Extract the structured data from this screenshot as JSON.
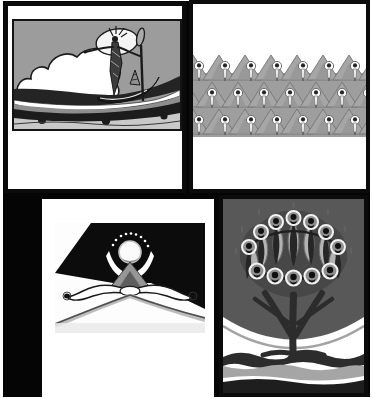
{
  "page": {
    "kind": "scanned-plate-collage",
    "background_color": "#050505",
    "paper_color": "#ffffff",
    "grid": "2x2 plates"
  },
  "plates": {
    "boat": {
      "name": "Haloed figure poling a boat",
      "description": "Thin robed figure with a large white oval halo stands in a gondola holding a long paddle; big scalloped white cloud at left, gray sky, dark sweeping water bands with drips below.",
      "position": "top-left"
    },
    "frieze": {
      "name": "Frieze of haloed figures among peaks",
      "description": "Repeating band of small haloed figures standing before overlapping gray mountain peaks; three staggered rows of seven figures.",
      "position": "top-right",
      "rows": 3,
      "figures_per_row": 7
    },
    "summit": {
      "name": "Orb above summit with bowing figures",
      "description": "Glowing white orb crowned by an arc of dots above a gray peak; two white bowing figures meet at the summit; black diagonal sky wedge; ridge lines descend to the corners.",
      "position": "bottom-left"
    },
    "tree": {
      "name": "Tree of haloed figures",
      "description": "Tree whose goblet-shaped canopy is formed by two rings of haloed figures with dark tapering bodies and light leaf petals; dark arched background; branching dark trunk; wavy water bands at the base.",
      "position": "bottom-right"
    }
  },
  "palette": {
    "ink": "#141414",
    "sky_gray": "#9c9c9c",
    "mountain_gray": "#a6a6a6",
    "dome_gray": "#585858",
    "light_gray": "#c9c9c9",
    "wave_dark": "#2a2a2a",
    "paper": "#ffffff"
  }
}
